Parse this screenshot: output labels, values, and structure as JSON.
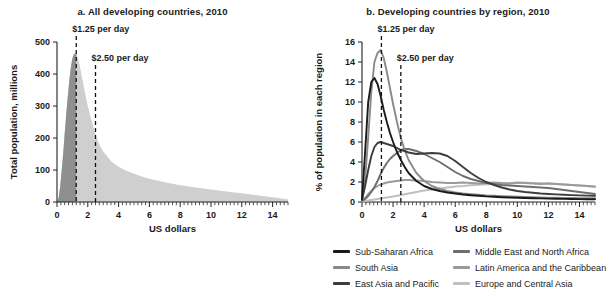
{
  "figure": {
    "xlabel": "US dollars"
  },
  "panel_a": {
    "title": "a.  All developing countries, 2010",
    "ylabel": "Total population, millions",
    "xlabel": "US dollars",
    "annotation_1": "$1.25 per day",
    "annotation_2": "$2.50 per day"
  },
  "panel_b": {
    "title": "b.  Developing countries by region, 2010",
    "ylabel": "% of population in each region",
    "xlabel": "US dollars",
    "annotation_1": "$1.25 per day",
    "annotation_2": "$2.50 per day"
  },
  "legend": {
    "items": [
      {
        "label": "Sub-Saharan Africa",
        "color": "#1a1a1a"
      },
      {
        "label": "Middle East and North Africa",
        "color": "#6e6e6e"
      },
      {
        "label": "South Asia",
        "color": "#8a8a8a"
      },
      {
        "label": "Latin America and the Caribbean",
        "color": "#9a9a9a"
      },
      {
        "label": "East Asia and Pacific",
        "color": "#3d3d3d"
      },
      {
        "label": "Europe and Central Asia",
        "color": "#c0c0c0"
      }
    ]
  },
  "chart_data": [
    {
      "type": "area",
      "title": "a.  All developing countries, 2010",
      "xlabel": "US dollars",
      "ylabel": "Total population, millions",
      "xlim": [
        0,
        15
      ],
      "ylim": [
        0,
        500
      ],
      "xticks": [
        0,
        2,
        4,
        6,
        8,
        10,
        12,
        14
      ],
      "yticks": [
        0,
        100,
        200,
        300,
        400,
        500
      ],
      "grid": false,
      "legend": "none",
      "annotations": [
        {
          "text": "$1.25 per day",
          "x": 1.25,
          "type": "vertical-dashed-line"
        },
        {
          "text": "$2.50 per day",
          "x": 2.5,
          "type": "vertical-dashed-line"
        }
      ],
      "fill_colors": {
        "below_1_25": "#8f8f8f",
        "above_1_25": "#cfcfcf"
      },
      "x": [
        0,
        0.1,
        0.2,
        0.3,
        0.4,
        0.5,
        0.6,
        0.7,
        0.8,
        0.9,
        1.0,
        1.1,
        1.2,
        1.25,
        1.3,
        1.4,
        1.5,
        1.6,
        1.8,
        2.0,
        2.2,
        2.4,
        2.5,
        2.6,
        2.8,
        3.0,
        3.5,
        4.0,
        4.5,
        5.0,
        5.5,
        6.0,
        6.5,
        7.0,
        7.5,
        8.0,
        8.5,
        9.0,
        9.5,
        10.0,
        10.5,
        11.0,
        11.5,
        12.0,
        12.5,
        13.0,
        13.5,
        14.0,
        14.5,
        15.0
      ],
      "values": [
        0,
        12,
        45,
        95,
        150,
        215,
        275,
        330,
        380,
        420,
        450,
        462,
        465,
        463,
        458,
        442,
        420,
        395,
        345,
        300,
        262,
        228,
        212,
        198,
        175,
        158,
        128,
        110,
        98,
        88,
        80,
        73,
        67,
        62,
        57,
        52,
        49,
        45,
        42,
        39,
        36,
        33,
        30,
        27,
        24,
        21,
        18,
        15,
        12,
        8
      ]
    },
    {
      "type": "line",
      "title": "b.  Developing countries by region, 2010",
      "xlabel": "US dollars",
      "ylabel": "% of population in each region",
      "xlim": [
        0,
        15
      ],
      "ylim": [
        0,
        16
      ],
      "xticks": [
        0,
        2,
        4,
        6,
        8,
        10,
        12,
        14
      ],
      "yticks": [
        0,
        2,
        4,
        6,
        8,
        10,
        12,
        14,
        16
      ],
      "grid": false,
      "legend": "bottom",
      "annotations": [
        {
          "text": "$1.25 per day",
          "x": 1.25,
          "type": "vertical-dashed-line"
        },
        {
          "text": "$2.50 per day",
          "x": 2.5,
          "type": "vertical-dashed-line"
        }
      ],
      "x": [
        0,
        0.2,
        0.4,
        0.6,
        0.8,
        1.0,
        1.2,
        1.4,
        1.6,
        1.8,
        2.0,
        2.25,
        2.5,
        2.75,
        3.0,
        3.5,
        4.0,
        4.5,
        5.0,
        5.5,
        6.0,
        6.5,
        7.0,
        7.5,
        8.0,
        8.5,
        9.0,
        9.5,
        10.0,
        10.5,
        11.0,
        11.5,
        12.0,
        12.5,
        13.0,
        13.5,
        14.0,
        14.5,
        15.0
      ],
      "series": [
        {
          "name": "Sub-Saharan Africa",
          "color": "#1a1a1a",
          "values": [
            0.3,
            5.0,
            10.0,
            12.0,
            12.4,
            11.8,
            10.6,
            9.2,
            8.0,
            6.9,
            6.0,
            5.0,
            4.2,
            3.5,
            2.9,
            2.1,
            1.6,
            1.3,
            1.1,
            0.95,
            0.85,
            0.75,
            0.68,
            0.62,
            0.56,
            0.52,
            0.48,
            0.45,
            0.42,
            0.4,
            0.38,
            0.36,
            0.34,
            0.32,
            0.31,
            0.3,
            0.29,
            0.28,
            0.27
          ]
        },
        {
          "name": "South Asia",
          "color": "#8a8a8a",
          "values": [
            0.2,
            2.2,
            6.5,
            11.0,
            14.0,
            14.9,
            15.2,
            14.4,
            13.0,
            11.4,
            9.8,
            8.0,
            6.4,
            5.2,
            4.2,
            2.9,
            2.1,
            1.6,
            1.3,
            1.1,
            0.95,
            0.85,
            0.78,
            0.72,
            0.66,
            0.62,
            0.58,
            0.55,
            0.52,
            0.5,
            0.48,
            0.46,
            0.44,
            0.42,
            0.41,
            0.4,
            0.39,
            0.38,
            0.37
          ]
        },
        {
          "name": "East Asia and Pacific",
          "color": "#3d3d3d",
          "values": [
            0.2,
            1.6,
            3.2,
            4.6,
            5.5,
            5.9,
            6.0,
            5.9,
            5.8,
            5.7,
            5.6,
            5.4,
            5.2,
            5.1,
            4.95,
            4.8,
            4.85,
            4.9,
            4.85,
            4.6,
            4.1,
            3.5,
            2.9,
            2.4,
            2.0,
            1.7,
            1.45,
            1.25,
            1.1,
            1.0,
            0.92,
            0.85,
            0.8,
            0.76,
            0.72,
            0.69,
            0.66,
            0.64,
            0.62
          ]
        },
        {
          "name": "Middle East and North Africa",
          "color": "#6e6e6e",
          "values": [
            0.1,
            0.3,
            0.6,
            1.0,
            1.5,
            2.1,
            2.8,
            3.4,
            3.9,
            4.3,
            4.6,
            4.9,
            5.2,
            5.3,
            5.3,
            5.1,
            4.8,
            4.4,
            4.0,
            3.5,
            3.0,
            2.6,
            2.3,
            2.1,
            1.9,
            1.8,
            1.7,
            1.65,
            1.6,
            1.55,
            1.5,
            1.45,
            1.4,
            1.3,
            1.2,
            1.1,
            1.0,
            0.9,
            0.8
          ]
        },
        {
          "name": "Latin America and the Caribbean",
          "color": "#9a9a9a",
          "values": [
            0.1,
            0.4,
            0.8,
            1.1,
            1.4,
            1.6,
            1.75,
            1.85,
            1.95,
            2.0,
            2.05,
            2.1,
            2.15,
            2.2,
            2.2,
            2.15,
            2.1,
            2.0,
            1.95,
            1.9,
            1.9,
            1.95,
            1.9,
            1.85,
            1.9,
            1.95,
            1.9,
            1.85,
            1.95,
            1.9,
            1.85,
            1.8,
            1.85,
            1.8,
            1.75,
            1.7,
            1.65,
            1.6,
            1.55
          ]
        },
        {
          "name": "Europe and Central Asia",
          "color": "#c0c0c0",
          "values": [
            0.05,
            0.1,
            0.15,
            0.2,
            0.25,
            0.3,
            0.35,
            0.4,
            0.45,
            0.5,
            0.55,
            0.62,
            0.7,
            0.78,
            0.85,
            1.0,
            1.15,
            1.25,
            1.35,
            1.45,
            1.55,
            1.6,
            1.68,
            1.72,
            1.78,
            1.82,
            1.85,
            1.88,
            1.9,
            1.92,
            1.9,
            1.88,
            1.85,
            1.8,
            1.75,
            1.7,
            1.65,
            1.6,
            1.5
          ]
        }
      ]
    }
  ]
}
